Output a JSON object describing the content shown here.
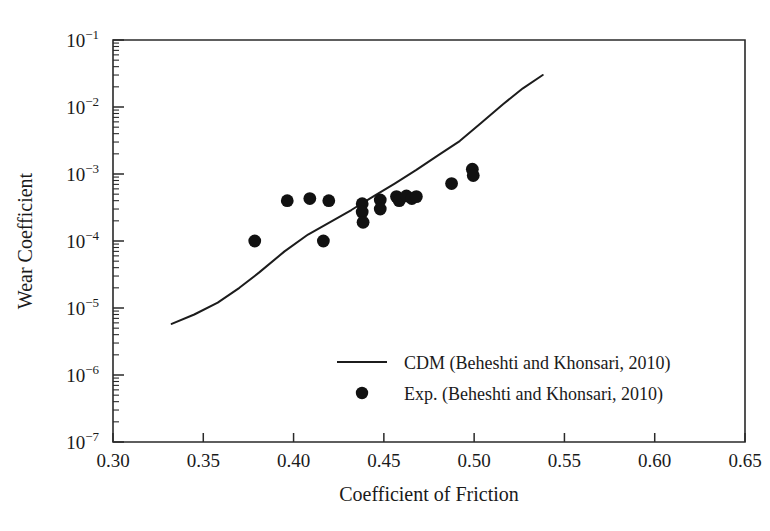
{
  "chart_data": {
    "type": "scatter",
    "title": "",
    "xlabel": "Coefficient of Friction",
    "ylabel": "Wear Coefficient",
    "xlim": [
      0.3,
      0.65
    ],
    "ylim": [
      1e-07,
      0.1
    ],
    "yscale": "log",
    "xscale": "linear",
    "grid": false,
    "legend_position": "inside-center-bottom",
    "x_ticks": [
      "0.30",
      "0.35",
      "0.40",
      "0.45",
      "0.50",
      "0.55",
      "0.60",
      "0.65"
    ],
    "x_tick_values": [
      0.3,
      0.35,
      0.4,
      0.45,
      0.5,
      0.55,
      0.6,
      0.65
    ],
    "y_ticks": [
      "10⁻¹",
      "10⁻²",
      "10⁻³",
      "10⁻⁴",
      "10⁻⁵",
      "10⁻⁶",
      "10⁻⁷"
    ],
    "y_tick_mantissa": [
      "10",
      "10",
      "10",
      "10",
      "10",
      "10",
      "10"
    ],
    "y_tick_exponents": [
      "-1",
      "-2",
      "-3",
      "-4",
      "-5",
      "-6",
      "-7"
    ],
    "y_tick_values": [
      0.1,
      0.01,
      0.001,
      0.0001,
      1e-05,
      1e-06,
      1e-07
    ],
    "minor_ticks": true,
    "series": [
      {
        "name": "CDM (Beheshti and Khonsari, 2010)",
        "type": "line",
        "marker": "none",
        "color": "#1c1c1c",
        "x": [
          0.3325,
          0.345,
          0.358,
          0.37,
          0.381,
          0.395,
          0.408,
          0.42,
          0.432,
          0.444,
          0.456,
          0.468,
          0.48,
          0.492,
          0.504,
          0.516,
          0.527,
          0.538
        ],
        "y": [
          5.8e-06,
          8e-06,
          1.2e-05,
          2e-05,
          3.4e-05,
          7e-05,
          0.000125,
          0.00019,
          0.00029,
          0.00046,
          0.00072,
          0.00115,
          0.0019,
          0.0031,
          0.0058,
          0.011,
          0.019,
          0.03
        ]
      },
      {
        "name": "Exp. (Beheshti and Khonsari, 2010)",
        "type": "scatter",
        "marker": "circle",
        "color": "#111111",
        "points": [
          {
            "x": 0.3785,
            "y": 0.0001
          },
          {
            "x": 0.3965,
            "y": 0.0004
          },
          {
            "x": 0.409,
            "y": 0.00043
          },
          {
            "x": 0.4195,
            "y": 0.0004
          },
          {
            "x": 0.4165,
            "y": 0.0001
          },
          {
            "x": 0.438,
            "y": 0.00036
          },
          {
            "x": 0.438,
            "y": 0.00027
          },
          {
            "x": 0.4385,
            "y": 0.00019
          },
          {
            "x": 0.448,
            "y": 0.00041
          },
          {
            "x": 0.448,
            "y": 0.0003
          },
          {
            "x": 0.457,
            "y": 0.00046
          },
          {
            "x": 0.4585,
            "y": 0.0004
          },
          {
            "x": 0.4625,
            "y": 0.00047
          },
          {
            "x": 0.4655,
            "y": 0.00043
          },
          {
            "x": 0.468,
            "y": 0.00046
          },
          {
            "x": 0.4875,
            "y": 0.00072
          },
          {
            "x": 0.499,
            "y": 0.00118
          },
          {
            "x": 0.4995,
            "y": 0.00095
          }
        ]
      }
    ]
  },
  "legend": {
    "entries": [
      {
        "label": "CDM (Beheshti and Khonsari, 2010)",
        "marker": "line"
      },
      {
        "label": "Exp. (Beheshti and Khonsari, 2010)",
        "marker": "dot"
      }
    ]
  },
  "axes": {
    "x_title": "Coefficient of Friction",
    "y_title": "Wear Coefficient"
  }
}
